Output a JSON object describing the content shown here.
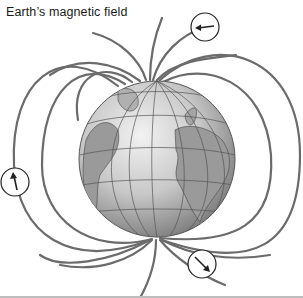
{
  "figure": {
    "title": "Earth’s magnetic field",
    "elements": {
      "field_lines": "magnetic field lines looping from south pole to north pole",
      "direction_markers": [
        {
          "position": "top-right",
          "arrow": "left"
        },
        {
          "position": "left",
          "arrow": "up"
        },
        {
          "position": "bottom-right",
          "arrow": "down-right"
        }
      ]
    },
    "colors": {
      "field_line": "#6b6b6b",
      "globe_light": "#e6e6e6",
      "globe_dark": "#7a7a7a",
      "land": "#9a9a9a",
      "grid": "#555555",
      "text": "#1a1a1a"
    }
  }
}
